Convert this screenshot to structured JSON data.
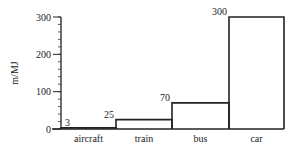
{
  "chart_data": {
    "type": "bar",
    "title": "",
    "xlabel": "",
    "ylabel": "m/MJ",
    "categories": [
      "aircraft",
      "train",
      "bus",
      "car"
    ],
    "values": [
      3,
      25,
      70,
      300
    ],
    "value_labels": [
      "3",
      "25",
      "70",
      "300"
    ],
    "ylim": [
      0,
      300
    ],
    "yticks": [
      0,
      100,
      200,
      300
    ],
    "ytick_labels": [
      "0",
      "100",
      "200",
      "300"
    ],
    "minor_tick_step": 20,
    "grid": false,
    "legend": null,
    "bar_style": "outlined, adjacent, no fill"
  }
}
